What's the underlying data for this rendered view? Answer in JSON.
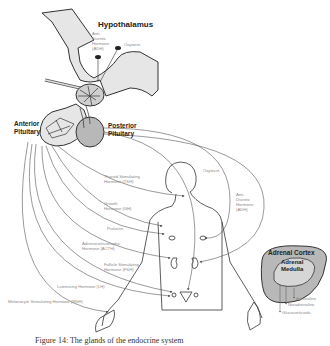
{
  "diagram": {
    "structures": {
      "hypothalamus": "Hypothalamus",
      "anterior_pituitary": "Anterior\nPituitary",
      "posterior_pituitary": "Posterior\nPituitary",
      "adrenal_cortex": "Adrenal Cortex",
      "adrenal_medulla": "Adrenal\nMedulla"
    },
    "hypothalamus_hormones": {
      "adh": "Anti-\nDiuretic\nHormone\n(ADH)",
      "oxytocin": "Oxytocin"
    },
    "anterior_pituitary_hormones": [
      {
        "id": "tsh",
        "label": "Thyroid Stimulating\nHormone (TSH)"
      },
      {
        "id": "gh",
        "label": "Growth\nHormone (GH)"
      },
      {
        "id": "prolactin",
        "label": "Prolactin"
      },
      {
        "id": "acth",
        "label": "Adrenocorticotrophic\nHormone (ACTH)"
      },
      {
        "id": "fsh",
        "label": "Follicle Stimulating\nHormone (FSH)"
      },
      {
        "id": "lh",
        "label": "Luteinising Hormone (LH)"
      },
      {
        "id": "msh",
        "label": "Melanocyte Stimulating Hormone (MSH)"
      }
    ],
    "posterior_pituitary_hormones": {
      "oxytocin": "Oxytocin",
      "adh": "Anti-\nDiuretic\nHormone\n(ADH)"
    },
    "adrenal_outputs": [
      "Adrenaline",
      "Noradrenaline",
      "Glucocorticoids"
    ],
    "colors": {
      "gland_fill": "#b8b8b8",
      "tissue_fill": "#e6e6e6",
      "outline": "#333333",
      "label_text": "#8a8a8a",
      "arrow_line": "#555555"
    }
  },
  "caption": "Figure 14: The glands of the endocrine system"
}
